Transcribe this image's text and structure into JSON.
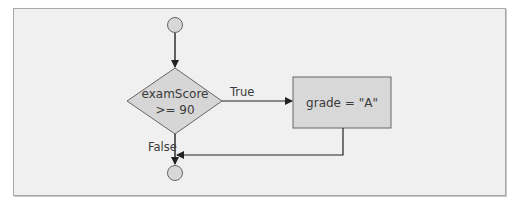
{
  "diagram": {
    "type": "flowchart",
    "decision": {
      "line1": "examScore",
      "line2": ">= 90"
    },
    "action": {
      "text": "grade = \"A\""
    },
    "edges": {
      "true_label": "True",
      "false_label": "False"
    },
    "colors": {
      "shape_fill": "#d6d6d6",
      "stroke": "#555555",
      "background": "#f0f0f0",
      "node_fill": "#d8d8d8"
    }
  }
}
